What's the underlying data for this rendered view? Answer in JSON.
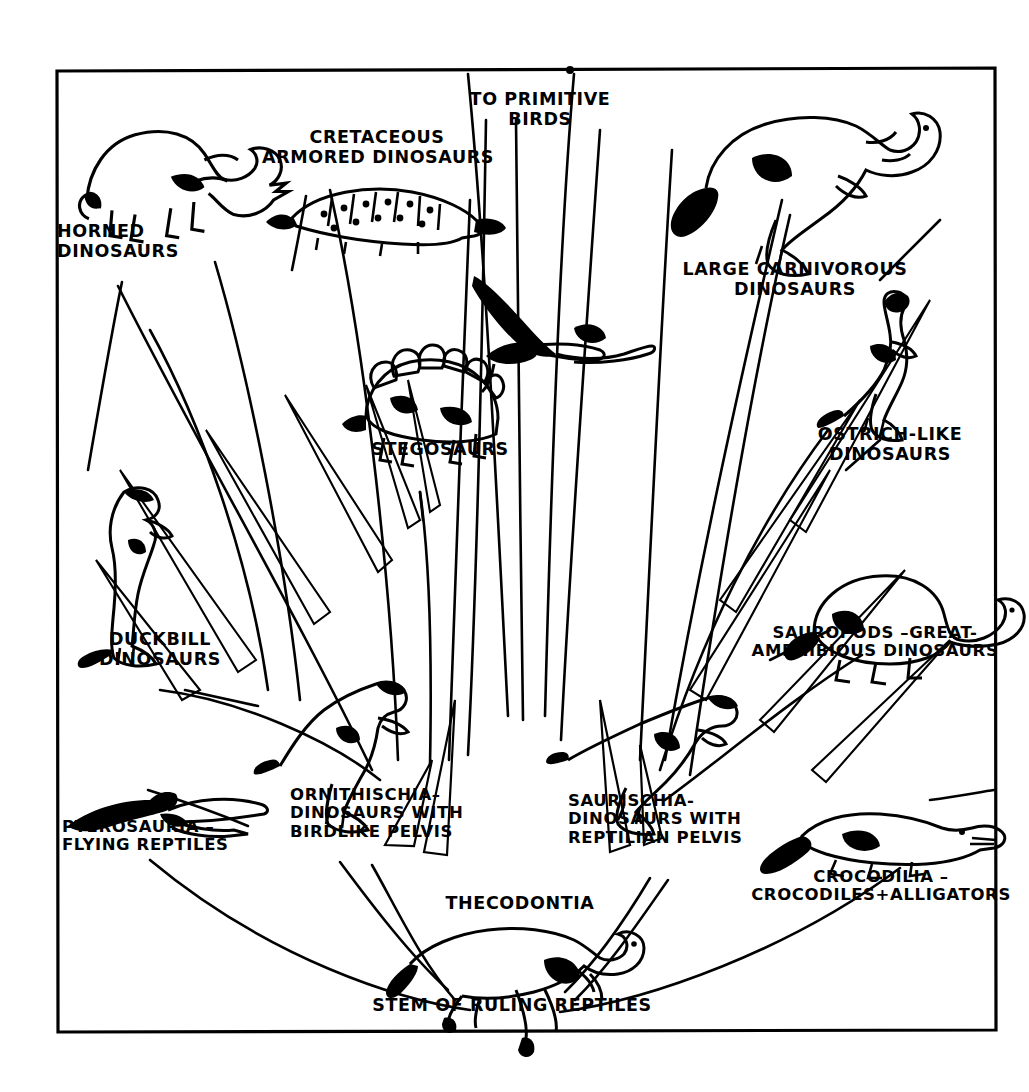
{
  "diagram": {
    "type": "phylogenetic-tree",
    "ink_color": "#000000",
    "background_color": "#ffffff",
    "frame": {
      "x": 56,
      "y": 70,
      "width": 939,
      "height": 960,
      "stroke": "#000000"
    },
    "root": {
      "label": "STEM OF RULING REPTILES",
      "x": 512,
      "y": 1010
    },
    "labels": {
      "to_primitive_birds": "TO PRIMITIVE\nBIRDS",
      "horned": "HORNED\nDINOSAURS",
      "armored": "CRETACEOUS\nARMORED DINOSAURS",
      "stegosaurs": "STEGOSAURS",
      "duckbill": "DUCKBILL\nDINOSAURS",
      "pterosauria": "PTEROSAURIA –\nFLYING REPTILES",
      "ornithischia": "ORNITHISCHIA–\nDINOSAURS WITH\nBIRDLIKE PELVIS",
      "thecodontia": "THECODONTIA",
      "stem": "STEM OF RULING REPTILES",
      "saurischia": "SAURISCHIA-\nDINOSAURS WITH\nREPTILIAN PELVIS",
      "crocodilia": "CROCODILIA –\nCROCODILES+ALLIGATORS",
      "sauropods": "SAUROPODS –GREAT-\nAMPHIBIOUS DINOSAURS",
      "ostrich": "OSTRICH-LIKE\nDINOSAURS",
      "carnivorous": "LARGE CARNIVOROUS\nDINOSAURS"
    },
    "nodes": [
      {
        "id": "stem",
        "label": "STEM OF RULING REPTILES",
        "icon": "thecodont-silhouette",
        "x": 512,
        "y": 1010
      },
      {
        "id": "thecodontia",
        "label": "THECODONTIA",
        "icon": "thecodont-silhouette",
        "x": 518,
        "y": 908
      },
      {
        "id": "pterosauria",
        "label": "PTEROSAURIA –\nFLYING REPTILES",
        "icon": "pterosaur-silhouette",
        "x": 150,
        "y": 838
      },
      {
        "id": "ornithischia",
        "label": "ORNITHISCHIA–\nDINOSAURS WITH\nBIRDLIKE PELVIS",
        "icon": "ornithischian-silhouette",
        "x": 365,
        "y": 817
      },
      {
        "id": "saurischia",
        "label": "SAURISCHIA-\nDINOSAURS WITH\nREPTILIAN PELVIS",
        "icon": "saurischian-silhouette",
        "x": 655,
        "y": 830
      },
      {
        "id": "crocodilia",
        "label": "CROCODILIA –\nCROCODILES+ALLIGATORS",
        "icon": "crocodile-silhouette",
        "x": 872,
        "y": 890
      },
      {
        "id": "duckbill",
        "label": "DUCKBILL\nDINOSAURS",
        "icon": "duckbill-silhouette",
        "x": 150,
        "y": 648
      },
      {
        "id": "horned",
        "label": "HORNED\nDINOSAURS",
        "icon": "triceratops-silhouette",
        "x": 135,
        "y": 243
      },
      {
        "id": "armored",
        "label": "CRETACEOUS\nARMORED DINOSAURS",
        "icon": "ankylosaur-silhouette",
        "x": 375,
        "y": 152
      },
      {
        "id": "stegosaurs",
        "label": "STEGOSAURS",
        "icon": "stegosaur-silhouette",
        "x": 437,
        "y": 455
      },
      {
        "id": "birds",
        "label": "TO PRIMITIVE\nBIRDS",
        "icon": "pterodactyl-silhouette",
        "x": 537,
        "y": 108
      },
      {
        "id": "sauropods",
        "label": "SAUROPODS –GREAT-\nAMPHIBIOUS DINOSAURS",
        "icon": "sauropod-silhouette",
        "x": 872,
        "y": 647
      },
      {
        "id": "ostrich",
        "label": "OSTRICH-LIKE\nDINOSAURS",
        "icon": "ornithomimid-silhouette",
        "x": 888,
        "y": 448
      },
      {
        "id": "carnivorous",
        "label": "LARGE CARNIVOROUS\nDINOSAURS",
        "icon": "tyrannosaur-silhouette",
        "x": 790,
        "y": 282
      }
    ]
  }
}
